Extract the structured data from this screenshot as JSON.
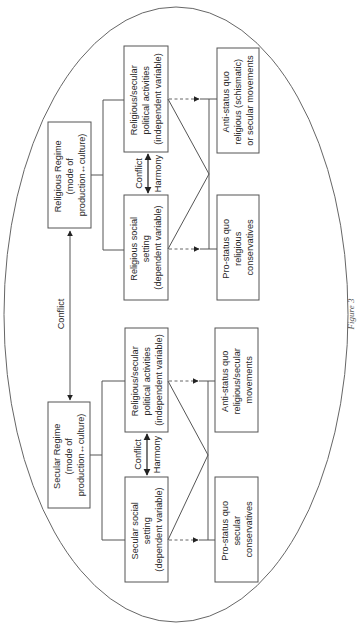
{
  "figure": {
    "caption": "Figure 3",
    "orientation": "rotated 90° counter-clockwise (landscape figure on portrait page)",
    "colors": {
      "stroke": "#555555",
      "text": "#2a2a2a",
      "background": "#ffffff"
    }
  },
  "regime_link": {
    "label": "Conflict"
  },
  "religious": {
    "regime": {
      "lines": [
        "Religious Regime",
        "(mode of",
        "production↔culture)"
      ]
    },
    "political": {
      "lines": [
        "Religious/secular",
        "political activities",
        "(independent variable)"
      ]
    },
    "social": {
      "lines": [
        "Religious social",
        "setting",
        "(dependent variable)"
      ]
    },
    "relation": {
      "conflict_label": "Conflict",
      "harmony_label": "Harmony"
    },
    "outcome_anti": {
      "lines": [
        "Anti-status quo",
        "religious (schismatic)",
        "or secular movements"
      ]
    },
    "outcome_pro": {
      "lines": [
        "Pro-status quo",
        "religious",
        "conservatives"
      ]
    }
  },
  "secular": {
    "regime": {
      "lines": [
        "Secular Regime",
        "(mode of",
        "production↔culture)"
      ]
    },
    "political": {
      "lines": [
        "Religious/secular",
        "political activities",
        "(independent variable)"
      ]
    },
    "social": {
      "lines": [
        "Secular social",
        "setting",
        "(dependent variable)"
      ]
    },
    "relation": {
      "conflict_label": "Conflict",
      "harmony_label": "Harmony"
    },
    "outcome_anti": {
      "lines": [
        "Anti-status quo",
        "religious/secular",
        "movements"
      ]
    },
    "outcome_pro": {
      "lines": [
        "Pro-status quo",
        "secular",
        "conservatives"
      ]
    }
  }
}
